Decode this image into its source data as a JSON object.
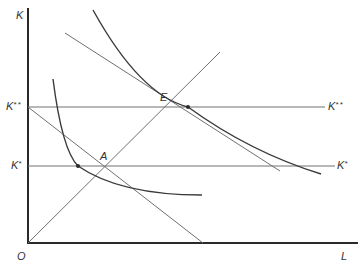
{
  "diagram": {
    "type": "economics-isoquant-expansion",
    "axes": {
      "y_label": "K",
      "x_label": "L",
      "origin_label": "O"
    },
    "levels": {
      "k_double_star": {
        "base": "K",
        "mark": "**"
      },
      "k_star": {
        "base": "K",
        "mark": "*"
      }
    },
    "points": {
      "A": "A",
      "E": "E"
    },
    "colors": {
      "axis": "#2a2a2a",
      "line": "#707070",
      "curve": "#3a3a3a",
      "text": "#333333"
    }
  }
}
